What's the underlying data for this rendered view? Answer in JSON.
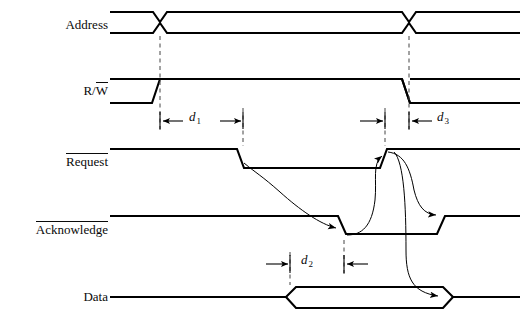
{
  "diagram": {
    "background_color": "#ffffff",
    "line_color": "#000000",
    "dash_color": "#555555",
    "signals": [
      {
        "name": "address",
        "label": "Address",
        "overline": false,
        "type": "bus",
        "row_y": 25
      },
      {
        "name": "read-write",
        "label_prefix": "R/",
        "label_overlined": "W",
        "label": "R/W",
        "overline": true,
        "type": "level",
        "row_y": 90
      },
      {
        "name": "request",
        "label": "Request",
        "overline": true,
        "type": "level",
        "row_y": 160
      },
      {
        "name": "acknowledge",
        "label": "Acknowledge",
        "overline": true,
        "type": "level",
        "row_y": 228
      },
      {
        "name": "data",
        "label": "Data",
        "overline": false,
        "type": "bus",
        "row_y": 297
      }
    ],
    "delays": [
      {
        "name": "d1",
        "label": "d",
        "sub": "1",
        "x": 195,
        "y": 116
      },
      {
        "name": "d3",
        "label": "d",
        "sub": "3",
        "x": 443,
        "y": 116
      },
      {
        "name": "d2",
        "label": "d",
        "sub": "2",
        "x": 307,
        "y": 259
      }
    ]
  }
}
